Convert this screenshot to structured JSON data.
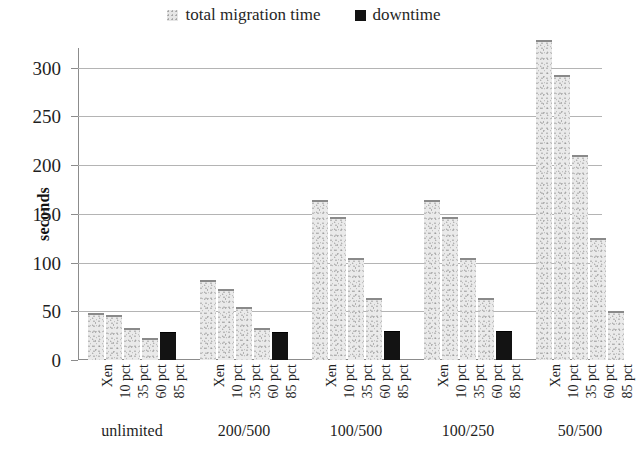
{
  "legend": {
    "position": "top-center",
    "entries": [
      {
        "label": "total migration time",
        "swatch": "light-gray-square",
        "color": "#e6e6e6"
      },
      {
        "label": "downtime",
        "swatch": "black-square",
        "color": "#131313"
      }
    ]
  },
  "chart_data": {
    "type": "bar",
    "title": "",
    "subtitle": "",
    "xlabel": "",
    "ylabel": "seconds",
    "ylim": [
      0,
      320
    ],
    "yticks": [
      0,
      50,
      100,
      150,
      200,
      250,
      300
    ],
    "ytick_labels": [
      "0",
      "50",
      "100",
      "150",
      "200",
      "250",
      "300"
    ],
    "grid": true,
    "grid_axis": "y",
    "legend": [
      "total migration time",
      "downtime"
    ],
    "colors": {
      "total_migration_time": "#e6e6e6",
      "downtime": "#131313"
    },
    "group_labels": [
      "unlimited",
      "200/500",
      "100/500",
      "100/250",
      "50/500"
    ],
    "categories": [
      "Xen",
      "10 pct",
      "35 pct",
      "60 pct",
      "85 pct"
    ],
    "groups": [
      {
        "group": "unlimited",
        "bars": [
          {
            "category": "Xen",
            "series": "total migration time",
            "value": 48
          },
          {
            "category": "10 pct",
            "series": "total migration time",
            "value": 46
          },
          {
            "category": "35 pct",
            "series": "total migration time",
            "value": 33
          },
          {
            "category": "60 pct",
            "series": "total migration time",
            "value": 23
          },
          {
            "category": "85 pct",
            "series": "downtime",
            "value": 29
          }
        ]
      },
      {
        "group": "200/500",
        "bars": [
          {
            "category": "Xen",
            "series": "total migration time",
            "value": 82
          },
          {
            "category": "10 pct",
            "series": "total migration time",
            "value": 73
          },
          {
            "category": "35 pct",
            "series": "total migration time",
            "value": 54
          },
          {
            "category": "60 pct",
            "series": "total migration time",
            "value": 33
          },
          {
            "category": "85 pct",
            "series": "downtime",
            "value": 29
          }
        ]
      },
      {
        "group": "100/500",
        "bars": [
          {
            "category": "Xen",
            "series": "total migration time",
            "value": 164
          },
          {
            "category": "10 pct",
            "series": "total migration time",
            "value": 147
          },
          {
            "category": "35 pct",
            "series": "total migration time",
            "value": 105
          },
          {
            "category": "60 pct",
            "series": "total migration time",
            "value": 64
          },
          {
            "category": "85 pct",
            "series": "downtime",
            "value": 30
          }
        ]
      },
      {
        "group": "100/250",
        "bars": [
          {
            "category": "Xen",
            "series": "total migration time",
            "value": 164
          },
          {
            "category": "10 pct",
            "series": "total migration time",
            "value": 147
          },
          {
            "category": "35 pct",
            "series": "total migration time",
            "value": 105
          },
          {
            "category": "60 pct",
            "series": "total migration time",
            "value": 64
          },
          {
            "category": "85 pct",
            "series": "downtime",
            "value": 30
          }
        ]
      },
      {
        "group": "50/500",
        "bars": [
          {
            "category": "Xen",
            "series": "total migration time",
            "value": 328
          },
          {
            "category": "10 pct",
            "series": "total migration time",
            "value": 292
          },
          {
            "category": "35 pct",
            "series": "total migration time",
            "value": 210
          },
          {
            "category": "60 pct",
            "series": "total migration time",
            "value": 125
          },
          {
            "category": "85 pct",
            "series": "total migration time",
            "value": 50
          }
        ]
      }
    ]
  }
}
